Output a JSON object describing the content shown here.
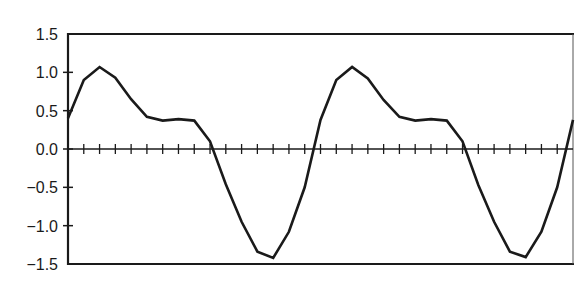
{
  "chart_data": {
    "type": "line",
    "title": "",
    "xlabel": "",
    "ylabel": "",
    "ylim": [
      -1.5,
      1.5
    ],
    "yticks": [
      1.5,
      1.0,
      0.5,
      0.0,
      -0.5,
      -1.0,
      -1.5
    ],
    "ytick_labels": [
      "1.5",
      "1.0",
      "0.5",
      "0.0",
      "−0.5",
      "−1.0",
      "−1.5"
    ],
    "x_tick_count": 31,
    "grid": false,
    "legend": null,
    "x": [
      0,
      1,
      2,
      3,
      4,
      5,
      6,
      7,
      8,
      9,
      10,
      11,
      12,
      13,
      14,
      15,
      16,
      17,
      18,
      19,
      20,
      21,
      22,
      23,
      24,
      25,
      26,
      27,
      28,
      29,
      30,
      31,
      32
    ],
    "series": [
      {
        "name": "waveform",
        "color": "#1a1a1a",
        "values": [
          0.4,
          0.9,
          1.07,
          0.93,
          0.65,
          0.42,
          0.37,
          0.39,
          0.37,
          0.1,
          -0.46,
          -0.95,
          -1.34,
          -1.42,
          -1.08,
          -0.5,
          0.38,
          0.9,
          1.07,
          0.92,
          0.64,
          0.42,
          0.37,
          0.39,
          0.37,
          0.1,
          -0.47,
          -0.95,
          -1.34,
          -1.41,
          -1.08,
          -0.5,
          0.38
        ]
      }
    ]
  }
}
